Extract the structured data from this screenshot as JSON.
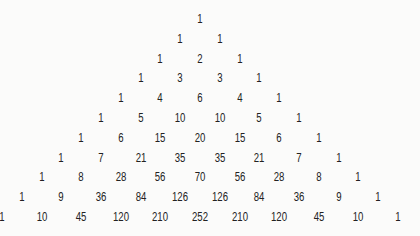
{
  "rows": [
    [
      1
    ],
    [
      1,
      1
    ],
    [
      1,
      2,
      1
    ],
    [
      1,
      3,
      3,
      1
    ],
    [
      1,
      4,
      6,
      4,
      1
    ],
    [
      1,
      5,
      10,
      10,
      5,
      1
    ],
    [
      1,
      6,
      15,
      20,
      15,
      6,
      1
    ],
    [
      1,
      7,
      21,
      35,
      35,
      21,
      7,
      1
    ],
    [
      1,
      8,
      28,
      56,
      70,
      56,
      28,
      8,
      1
    ],
    [
      1,
      9,
      36,
      84,
      126,
      126,
      84,
      36,
      9,
      1
    ],
    [
      1,
      10,
      45,
      120,
      210,
      252,
      210,
      120,
      45,
      10,
      1
    ]
  ],
  "layout": {
    "center_x": 200,
    "first_row_y": 19,
    "row_spacing": 19.8,
    "col_spacing": 39.6,
    "text_color": "#222222",
    "background": "#fbfbfa"
  }
}
